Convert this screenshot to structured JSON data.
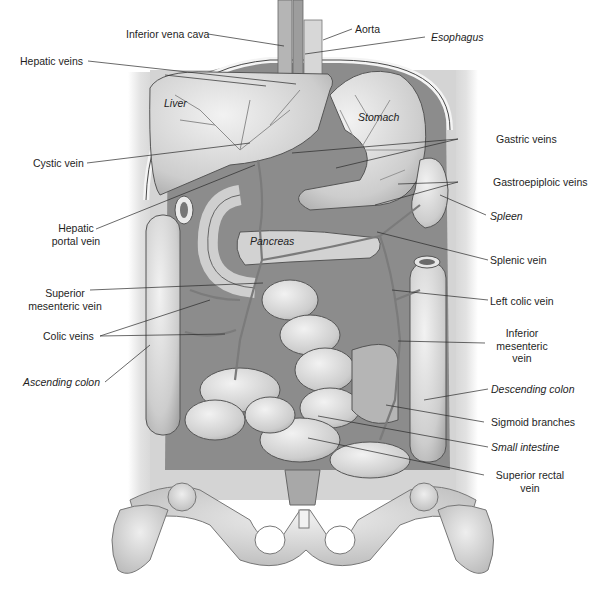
{
  "figure": {
    "colors": {
      "background": "#ffffff",
      "body_wall": "#d9d9d9",
      "cavity": "#8f8f8f",
      "organ_light": "#e6e6e6",
      "organ_mid": "#c4c4c4",
      "vessel": "#6b6b6b",
      "leader_line": "#2a2a2a",
      "text": "#1e1e1e"
    }
  },
  "labels": {
    "inferior_vena_cava": "Inferior vena cava",
    "aorta": "Aorta",
    "esophagus": "Esophagus",
    "hepatic_veins": "Hepatic veins",
    "cystic_vein": "Cystic vein",
    "gastric_veins": "Gastric veins",
    "gastroepiploic_veins": "Gastroepiploic veins",
    "hepatic_portal_vein_1": "Hepatic",
    "hepatic_portal_vein_2": "portal vein",
    "spleen": "Spleen",
    "splenic_vein": "Splenic vein",
    "superior_mesenteric_vein_1": "Superior",
    "superior_mesenteric_vein_2": "mesenteric vein",
    "left_colic_vein": "Left colic vein",
    "colic_veins": "Colic veins",
    "inferior_mesenteric_vein_1": "Inferior",
    "inferior_mesenteric_vein_2": "mesenteric",
    "inferior_mesenteric_vein_3": "vein",
    "ascending_colon": "Ascending colon",
    "descending_colon": "Descending colon",
    "sigmoid_branches": "Sigmoid branches",
    "small_intestine": "Small intestine",
    "superior_rectal_vein_1": "Superior rectal",
    "superior_rectal_vein_2": "vein"
  },
  "organ_labels": {
    "liver": "Liver",
    "stomach": "Stomach",
    "pancreas": "Pancreas"
  }
}
